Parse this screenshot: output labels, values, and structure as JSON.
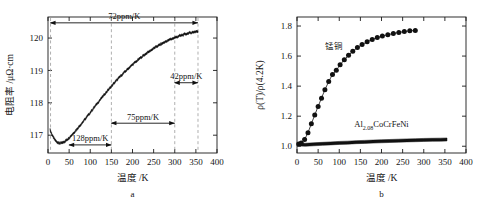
{
  "figure": {
    "background": "#ffffff",
    "foreground": "#141414"
  },
  "panels": [
    {
      "id": "a",
      "letter": "a",
      "axes": {
        "x": {
          "title": "温度 /K",
          "min": 0,
          "max": 400,
          "ticks": [
            0,
            50,
            100,
            150,
            200,
            250,
            300,
            350,
            400
          ],
          "tick_labels": [
            "0",
            "50",
            "100",
            "150",
            "200",
            "250",
            "300",
            "350",
            "400"
          ]
        },
        "y": {
          "title": "电阻率 /μΩ·cm",
          "min": 116.45,
          "max": 120.65,
          "ticks": [
            117,
            118,
            119,
            120
          ],
          "tick_labels": [
            "117",
            "118",
            "119",
            "120"
          ]
        }
      },
      "annotations": [
        {
          "label": "72ppm/K",
          "x_from": 6,
          "x_to": 355,
          "y_value": 120.47,
          "label_above": true
        },
        {
          "label": "42ppm/K",
          "x_from": 300,
          "x_to": 355,
          "y_value": 118.62,
          "label_above": true
        },
        {
          "label": "75ppm/K",
          "x_from": 150,
          "x_to": 300,
          "y_value": 117.37,
          "label_above": true
        },
        {
          "label": "128ppm/K",
          "x_from": 50,
          "x_to": 150,
          "y_value": 116.7,
          "label_above": true
        }
      ],
      "guide_lines": [
        6,
        150,
        300,
        355
      ]
    },
    {
      "id": "b",
      "letter": "b",
      "axes": {
        "x": {
          "title": "温度 /K",
          "min": 0,
          "max": 400,
          "ticks": [
            0,
            50,
            100,
            150,
            200,
            250,
            300,
            350,
            400
          ],
          "tick_labels": [
            "0",
            "50",
            "100",
            "150",
            "200",
            "250",
            "300",
            "350",
            "400"
          ]
        },
        "y": {
          "title": "ρ(T)/ρ(4.2K)",
          "min": 0.955,
          "max": 1.86,
          "ticks": [
            1.0,
            1.2,
            1.4,
            1.6,
            1.8
          ],
          "tick_labels": [
            "1.0",
            "1.2",
            "1.4",
            "1.6",
            "1.8"
          ]
        }
      },
      "series_labels": [
        {
          "text": "锰铜",
          "x_value": 88,
          "y_value": 1.645
        },
        {
          "text": "Al",
          "sub": "2.08",
          "tail": "CoCrFeNi",
          "x_value": 200,
          "y_value": 1.125
        }
      ]
    }
  ],
  "chart_data": [
    {
      "type": "line",
      "panel": "a",
      "title": "",
      "xlabel": "温度 /K",
      "ylabel": "电阻率 /μΩ·cm",
      "xlim": [
        0,
        400
      ],
      "ylim": [
        116.45,
        120.65
      ],
      "grid": false,
      "legend": "none",
      "noise_amplitude": 0.022,
      "series": [
        {
          "name": "Al2.08CoCrFeNi resistivity",
          "x": [
            5,
            10,
            15,
            20,
            25,
            30,
            35,
            40,
            45,
            50,
            60,
            70,
            80,
            90,
            100,
            110,
            120,
            130,
            140,
            150,
            160,
            170,
            180,
            190,
            200,
            210,
            220,
            230,
            240,
            250,
            260,
            270,
            280,
            290,
            300,
            310,
            320,
            330,
            340,
            350,
            355
          ],
          "y": [
            117.16,
            117.0,
            116.88,
            116.8,
            116.76,
            116.75,
            116.77,
            116.81,
            116.86,
            116.92,
            117.06,
            117.21,
            117.37,
            117.53,
            117.7,
            117.87,
            118.04,
            118.2,
            118.36,
            118.51,
            118.66,
            118.8,
            118.93,
            119.06,
            119.18,
            119.29,
            119.4,
            119.5,
            119.59,
            119.68,
            119.76,
            119.83,
            119.9,
            119.96,
            120.01,
            120.06,
            120.1,
            120.14,
            120.17,
            120.2,
            120.21
          ]
        }
      ],
      "annotations": [
        "72ppm/K",
        "42ppm/K",
        "75ppm/K",
        "128ppm/K"
      ]
    },
    {
      "type": "line",
      "panel": "b",
      "title": "",
      "xlabel": "温度 /K",
      "ylabel": "ρ(T)/ρ(4.2K)",
      "xlim": [
        0,
        400
      ],
      "ylim": [
        0.955,
        1.86
      ],
      "grid": false,
      "legend": "inline-labels",
      "series": [
        {
          "name": "锰铜",
          "marker": "filled-circle",
          "x": [
            4,
            10,
            18,
            26,
            34,
            42,
            50,
            58,
            66,
            75,
            84,
            93,
            102,
            112,
            122,
            132,
            143,
            154,
            166,
            178,
            190,
            202,
            215,
            228,
            241,
            254,
            267,
            280
          ],
          "y": [
            1.015,
            1.022,
            1.045,
            1.09,
            1.15,
            1.208,
            1.265,
            1.32,
            1.376,
            1.43,
            1.478,
            1.505,
            1.542,
            1.575,
            1.605,
            1.632,
            1.657,
            1.677,
            1.695,
            1.71,
            1.723,
            1.733,
            1.742,
            1.75,
            1.757,
            1.763,
            1.768,
            1.77
          ]
        },
        {
          "name": "Al2.08CoCrFeNi",
          "marker": "filled-circle-small",
          "x": [
            4,
            20,
            40,
            60,
            80,
            100,
            120,
            140,
            160,
            180,
            200,
            220,
            240,
            260,
            280,
            300,
            320,
            340,
            355
          ],
          "y": [
            1.012,
            1.01,
            1.013,
            1.016,
            1.019,
            1.022,
            1.024,
            1.027,
            1.029,
            1.031,
            1.033,
            1.035,
            1.037,
            1.039,
            1.04,
            1.042,
            1.043,
            1.044,
            1.045
          ]
        }
      ]
    }
  ]
}
